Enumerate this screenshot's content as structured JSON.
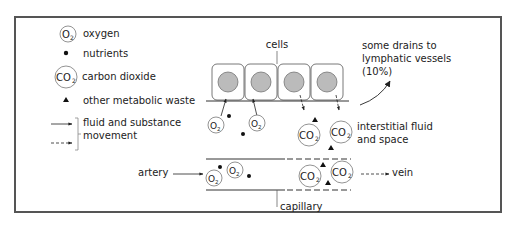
{
  "legend": {
    "oxygen": {
      "symbol": "O2",
      "label": "oxygen"
    },
    "nutrients": {
      "symbol": "dot",
      "label": "nutrients"
    },
    "carbon_dioxide": {
      "symbol": "CO2",
      "label": "carbon dioxide"
    },
    "waste": {
      "symbol": "triangle",
      "label": "other metabolic waste"
    },
    "movement": {
      "label_line1": "fluid and substance",
      "label_line2": "movement"
    }
  },
  "labels": {
    "cells": "cells",
    "lymph_line1": "some drains to",
    "lymph_line2": "lymphatic vessels",
    "lymph_line3": "(10%)",
    "interstitial_line1": "interstitial fluid",
    "interstitial_line2": "and space",
    "artery": "artery",
    "vein": "vein",
    "capillary": "capillary"
  },
  "symbols": {
    "o2": "O",
    "co2": "CO",
    "sub2": "2"
  },
  "colors": {
    "frame": "#555555",
    "line": "#333333",
    "nucleus": "#b8b8b8",
    "circle": "#777777"
  }
}
